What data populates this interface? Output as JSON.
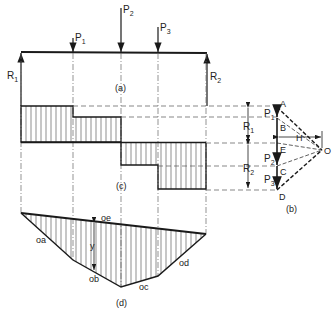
{
  "figure": {
    "panels": {
      "a": "(a)",
      "b": "(b)",
      "c": "(c)",
      "d": "(d)"
    },
    "beam": {
      "loads": [
        {
          "label": "P",
          "sub": "1"
        },
        {
          "label": "P",
          "sub": "2"
        },
        {
          "label": "P",
          "sub": "3"
        }
      ],
      "reactions": [
        {
          "label": "R",
          "sub": "1"
        },
        {
          "label": "R",
          "sub": "2"
        }
      ]
    },
    "force_polygon": {
      "points": [
        "A",
        "B",
        "E",
        "C",
        "D",
        "O"
      ],
      "pole_distance_label": "H",
      "segment_labels": [
        {
          "label": "P",
          "sub": "1"
        },
        {
          "label": "P",
          "sub": "2"
        },
        {
          "label": "P",
          "sub": "3"
        }
      ],
      "reaction_labels": [
        {
          "label": "R",
          "sub": "1"
        },
        {
          "label": "R",
          "sub": "2"
        }
      ]
    },
    "moment_diagram": {
      "ray_labels": [
        "oa",
        "ob",
        "oc",
        "od",
        "oe"
      ],
      "ordinate_label": "y"
    },
    "colors": {
      "line": "#1a1a1a",
      "hatch": "#444444",
      "dash": "#555555"
    }
  }
}
